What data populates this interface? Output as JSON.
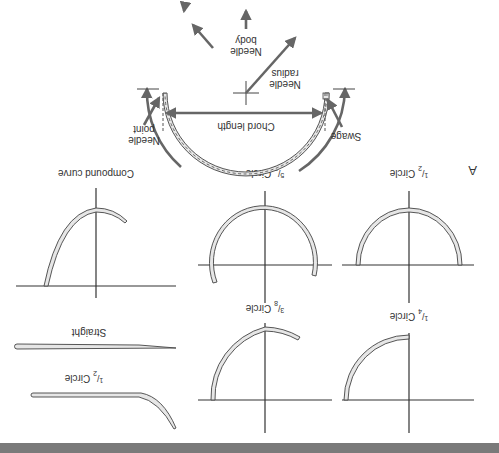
{
  "figure": {
    "orientation_degrees": 180,
    "panel_label": "A",
    "bottom_bar_color": "#7a7a7a",
    "needle_fill_color": "#e6e6e6",
    "arrow_color": "#666666"
  },
  "anatomy": {
    "labels": {
      "needle_point": [
        "Needle",
        "point"
      ],
      "chord_length": "Chord length",
      "swage": "Swage",
      "needle_radius": [
        "Needle",
        "radius"
      ],
      "needle_body": [
        "Needle",
        "body"
      ]
    }
  },
  "shapes": [
    {
      "id": "half-circle",
      "label_num": "1",
      "label_den": "2",
      "label_suffix": " Circle"
    },
    {
      "id": "five-eighths-circle",
      "label_num": "5",
      "label_den": "8",
      "label_suffix": " Circle"
    },
    {
      "id": "compound-curve",
      "label": "Compound curve"
    },
    {
      "id": "quarter-circle",
      "label_num": "1",
      "label_den": "4",
      "label_suffix": " Circle"
    },
    {
      "id": "three-eighths-circle",
      "label_num": "3",
      "label_den": "8",
      "label_suffix": " Circle"
    },
    {
      "id": "straight",
      "label": "Straight"
    },
    {
      "id": "half-curved",
      "label_num": "1",
      "label_den": "2",
      "label_suffix": " Circle"
    }
  ]
}
